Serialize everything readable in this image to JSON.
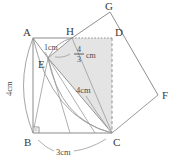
{
  "figure": {
    "kind": "geometry-diagram",
    "colors": {
      "stroke": "#8a8a8a",
      "stroke_dark": "#6f6f6f",
      "label_text": "#3a3a3a",
      "measure_text": "#4a4a4a",
      "shade_fill": "#e4e4e4",
      "background": "#ffffff"
    },
    "vertices": [
      {
        "name": "A",
        "label": "A",
        "x": 33,
        "y": 38,
        "label_x": 23,
        "label_y": 36
      },
      {
        "name": "B",
        "label": "B",
        "x": 33,
        "y": 133,
        "label_x": 24,
        "label_y": 146
      },
      {
        "name": "C",
        "label": "C",
        "x": 112,
        "y": 133,
        "label_x": 113,
        "label_y": 146
      },
      {
        "name": "D",
        "label": "D",
        "x": 112,
        "y": 38,
        "label_x": 115,
        "label_y": 36
      },
      {
        "name": "E",
        "label": "E",
        "x": 48,
        "y": 58,
        "label_x": 38,
        "label_y": 68
      },
      {
        "name": "F",
        "label": "F",
        "x": 158,
        "y": 95,
        "label_x": 162,
        "label_y": 99
      },
      {
        "name": "G",
        "label": "G",
        "x": 110,
        "y": 12,
        "label_x": 105,
        "label_y": 10
      },
      {
        "name": "H",
        "label": "H",
        "x": 72,
        "y": 38,
        "label_x": 67,
        "label_y": 35
      }
    ],
    "measurements": [
      {
        "name": "ae-length",
        "text": "1cm",
        "x": 44,
        "y": 50
      },
      {
        "name": "eh-length",
        "numerator": "4",
        "denominator": "3",
        "unit": "cm",
        "x": 80,
        "y": 54
      },
      {
        "name": "ec-length",
        "text": "4cm",
        "x": 80,
        "y": 92
      },
      {
        "name": "ab-length",
        "text": "4cm",
        "x": 8,
        "y": 92
      },
      {
        "name": "bc-length",
        "text": "3cm",
        "x": 62,
        "y": 153
      }
    ],
    "right_angle": {
      "name": "right-angle-at-b",
      "x": 33,
      "y": 133,
      "size": 6
    }
  }
}
